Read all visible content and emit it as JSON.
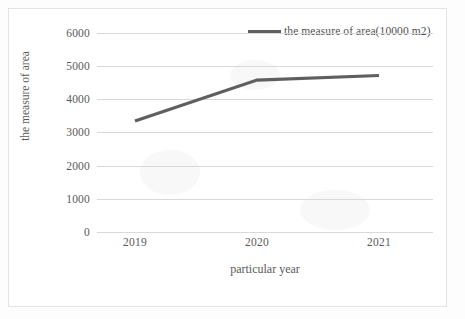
{
  "chart_data": {
    "type": "line",
    "title": "",
    "xlabel": "particular year",
    "ylabel": "the measure of area",
    "categories": [
      "2019",
      "2020",
      "2021"
    ],
    "series": [
      {
        "name": "the measure of area(10000 m2)",
        "values": [
          3350,
          4580,
          4720
        ],
        "color": "#5f5f5f"
      }
    ],
    "ylim": [
      0,
      6000
    ],
    "yticks": [
      6000,
      5000,
      4000,
      3000,
      2000,
      1000,
      0
    ],
    "ytick_labels": [
      "6000",
      "5000",
      "4000",
      "3000",
      "2000",
      "1000",
      "0"
    ],
    "grid": true,
    "legend_position": "top-right"
  },
  "legend": {
    "entries": [
      {
        "label": "the measure of area(10000 m2)",
        "color": "#5f5f5f"
      }
    ]
  },
  "axes": {
    "y_title": "the measure of area",
    "x_title": "particular year"
  }
}
